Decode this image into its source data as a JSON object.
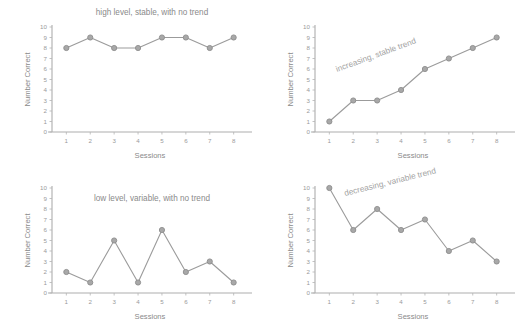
{
  "figure": {
    "background_color": "#ffffff",
    "line_color": "#9b9b9b",
    "marker_fill_color": "#a8a8a8",
    "marker_edge_color": "#8d8d8d",
    "axis_color": "#adadad",
    "text_color": "#8a8a8a",
    "panel_count": 4
  },
  "chart_data": [
    {
      "type": "line",
      "panel": "top-left",
      "title": "high level, stable, with no trend",
      "annotation": "",
      "xlabel": "Sessions",
      "ylabel": "Number Correct",
      "x": [
        1,
        2,
        3,
        4,
        5,
        6,
        7,
        8
      ],
      "categories": [
        "1",
        "2",
        "3",
        "4",
        "5",
        "6",
        "7",
        "8"
      ],
      "values": [
        8,
        9,
        8,
        8,
        9,
        9,
        8,
        9
      ],
      "yticks": [
        "10",
        "9",
        "8",
        "7",
        "6",
        "5",
        "4",
        "3",
        "2",
        "1",
        "0"
      ],
      "ylim": [
        0,
        10
      ],
      "xlim": [
        0.4,
        8.6
      ],
      "grid": false,
      "legend": "none"
    },
    {
      "type": "line",
      "panel": "top-right",
      "title": "",
      "annotation": "increasing, stable trend",
      "xlabel": "Sessions",
      "ylabel": "Number Correct",
      "x": [
        1,
        2,
        3,
        4,
        5,
        6,
        7,
        8
      ],
      "categories": [
        "1",
        "2",
        "3",
        "4",
        "5",
        "6",
        "7",
        "8"
      ],
      "values": [
        1,
        3,
        3,
        4,
        6,
        7,
        8,
        9
      ],
      "yticks": [
        "10",
        "9",
        "8",
        "7",
        "6",
        "5",
        "4",
        "3",
        "2",
        "1",
        "0"
      ],
      "ylim": [
        0,
        10
      ],
      "xlim": [
        0.4,
        8.6
      ],
      "grid": false,
      "legend": "none"
    },
    {
      "type": "line",
      "panel": "bottom-left",
      "title": "low level, variable, with no trend",
      "annotation": "",
      "xlabel": "Sessions",
      "ylabel": "Number Correct",
      "x": [
        1,
        2,
        3,
        4,
        5,
        6,
        7,
        8
      ],
      "categories": [
        "1",
        "2",
        "3",
        "4",
        "5",
        "6",
        "7",
        "8"
      ],
      "values": [
        2,
        1,
        5,
        1,
        6,
        2,
        3,
        1
      ],
      "yticks": [
        "10",
        "9",
        "8",
        "7",
        "6",
        "5",
        "4",
        "3",
        "2",
        "1",
        "0"
      ],
      "ylim": [
        0,
        10
      ],
      "xlim": [
        0.4,
        8.6
      ],
      "grid": false,
      "legend": "none"
    },
    {
      "type": "line",
      "panel": "bottom-right",
      "title": "",
      "annotation": "decreasing, variable trend",
      "xlabel": "Sessions",
      "ylabel": "Number Correct",
      "x": [
        1,
        2,
        3,
        4,
        5,
        6,
        7,
        8
      ],
      "categories": [
        "1",
        "2",
        "3",
        "4",
        "5",
        "6",
        "7",
        "8"
      ],
      "values": [
        10,
        6,
        8,
        6,
        7,
        4,
        5,
        3
      ],
      "yticks": [
        "10",
        "9",
        "8",
        "7",
        "6",
        "5",
        "4",
        "3",
        "2",
        "1",
        "0"
      ],
      "ylim": [
        0,
        10
      ],
      "xlim": [
        0.4,
        8.6
      ],
      "grid": false,
      "legend": "none"
    }
  ]
}
